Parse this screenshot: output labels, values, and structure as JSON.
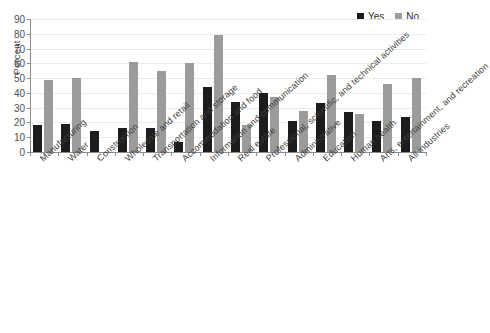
{
  "chart_data": {
    "type": "bar",
    "title": "",
    "xlabel": "",
    "ylabel": "Percent",
    "ylim": [
      0,
      90
    ],
    "yticks": [
      0,
      10,
      20,
      30,
      40,
      50,
      60,
      70,
      80,
      90
    ],
    "grid": true,
    "legend_position": "top-right",
    "categories": [
      "Manufacturing",
      "Water",
      "Construction",
      "Wholesale and retail",
      "Transportation and storage",
      "Accommodation and food",
      "Information and communication",
      "Real estate",
      "Professional, scientific, and technical activities",
      "Administrative",
      "Education",
      "Human health",
      "Arts, entertainment, and recreation",
      "All industries"
    ],
    "series": [
      {
        "name": "Yes",
        "color": "#1c1c1c",
        "values": [
          18,
          19,
          14,
          16,
          16,
          7,
          44,
          34,
          40,
          21,
          33,
          27,
          21,
          24
        ]
      },
      {
        "name": "No",
        "color": "#9b9b9b",
        "values": [
          49,
          50,
          0,
          61,
          55,
          60,
          79,
          18,
          37,
          28,
          52,
          26,
          46,
          50
        ]
      }
    ]
  },
  "legend": {
    "items": [
      {
        "label": "Yes",
        "swatch": "yes"
      },
      {
        "label": "No",
        "swatch": "no"
      }
    ]
  },
  "axes": {
    "y_title": "Percent"
  },
  "caption": ""
}
